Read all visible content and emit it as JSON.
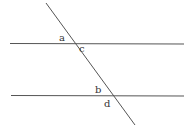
{
  "diagram": {
    "line_color": "#555555",
    "lines": {
      "top_parallel": {
        "x1": 10,
        "y1": 43,
        "x2": 184,
        "y2": 44
      },
      "bottom_parallel": {
        "x1": 11,
        "y1": 95,
        "x2": 184,
        "y2": 96
      },
      "transversal": {
        "x1": 46,
        "y1": 3,
        "x2": 135,
        "y2": 125
      }
    },
    "angle_labels": {
      "a": "a",
      "b": "b",
      "c": "c",
      "d": "d"
    }
  }
}
